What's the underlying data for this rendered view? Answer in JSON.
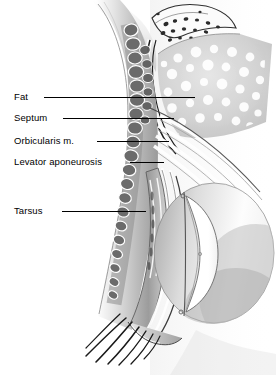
{
  "figure": {
    "kind": "anatomical-illustration",
    "background_color": "#ffffff",
    "width": 276,
    "height": 375
  },
  "labels": [
    {
      "id": "fat",
      "text": "Fat",
      "x": 14,
      "y": 92,
      "leader_x1": 44,
      "leader_x2": 195,
      "leader_y": 97,
      "target": "orbital-fat-pad"
    },
    {
      "id": "septum",
      "text": "Septum",
      "x": 14,
      "y": 113,
      "leader_x1": 63,
      "leader_x2": 174,
      "leader_y": 118,
      "target": "orbital-septum"
    },
    {
      "id": "orbic",
      "text": "Orbicularis m.",
      "x": 14,
      "y": 136,
      "leader_x1": 97,
      "leader_x2": 169,
      "leader_y": 141,
      "target": "orbicularis-muscle"
    },
    {
      "id": "levator",
      "text": "Levator aponeurosis",
      "x": 14,
      "y": 157,
      "leader_x1": 130,
      "leader_x2": 164,
      "leader_y": 162,
      "target": "levator-aponeurosis"
    },
    {
      "id": "tarsus",
      "text": "Tarsus",
      "x": 14,
      "y": 206,
      "leader_x1": 62,
      "leader_x2": 146,
      "leader_y": 211,
      "target": "tarsal-plate"
    }
  ],
  "structures": [
    {
      "id": "orbital-fat-pad",
      "name": "Orbital fat pad",
      "tone": "pale gray with white lobular stipple"
    },
    {
      "id": "orbital-septum",
      "name": "Orbital septum",
      "tone": "thin white band with dark outline"
    },
    {
      "id": "orbicularis-muscle",
      "name": "Orbicularis oculi muscle",
      "tone": "chain of dark gray bundle cross-sections"
    },
    {
      "id": "levator-aponeurosis",
      "name": "Levator aponeurosis",
      "tone": "pale fibrous bands"
    },
    {
      "id": "tarsal-plate",
      "name": "Tarsus",
      "tone": "dense gray plate"
    },
    {
      "id": "globe",
      "name": "Globe (eyeball)",
      "tone": "white with gray shading"
    },
    {
      "id": "cornea",
      "name": "Cornea",
      "tone": "bright white lens-shaped"
    },
    {
      "id": "eyelashes",
      "name": "Eyelashes",
      "tone": "thin dark curved strands"
    },
    {
      "id": "skin",
      "name": "Eyelid skin",
      "tone": "smooth gray surface"
    },
    {
      "id": "orbital-rim",
      "name": "Superior orbital rim",
      "tone": "white with dark speckles"
    }
  ],
  "palette": {
    "ink": "#000000",
    "skin_light": "#d8d8d8",
    "skin_mid": "#b4b4b4",
    "skin_dark": "#8a8a8a",
    "muscle": "#6f6f6f",
    "muscle_dark": "#4a4a4a",
    "fat": "#cfcfcf",
    "globe": "#fbfbfb"
  }
}
